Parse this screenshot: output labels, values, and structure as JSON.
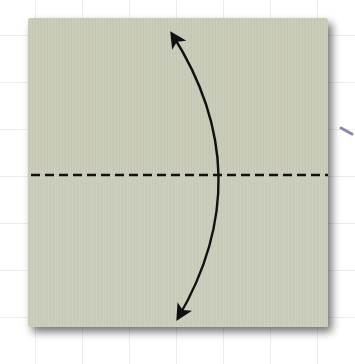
{
  "diagram": {
    "type": "origami-fold-step",
    "background": {
      "color": "#ffffff",
      "grid_color": "#d9dbe0",
      "grid_spacing": 47
    },
    "paper": {
      "color": "#c9cbb8",
      "shadow_color": "#6f6f6f",
      "x": 28,
      "y": 18,
      "width": 300,
      "height": 309
    },
    "fold_line": {
      "style": "dashed",
      "color": "#111111",
      "y": 175,
      "x1": 30,
      "x2": 330
    },
    "arrow": {
      "style": "curved-double-headed",
      "meaning": "fold up and unfold",
      "color": "#111111"
    },
    "side_mark": {
      "color": "#8c86b3"
    }
  }
}
